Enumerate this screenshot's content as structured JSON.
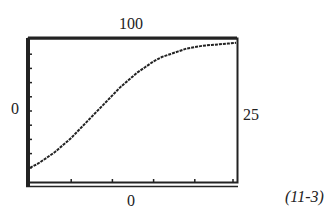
{
  "labels": {
    "top": "100",
    "left": "0",
    "right": "25",
    "bottom": "0",
    "equation_ref": "(11-3)"
  },
  "chart_data": {
    "type": "line",
    "title": "",
    "xlabel": "",
    "ylabel": "",
    "window": {
      "xmin": 0,
      "xmax": 25,
      "ymin": 0,
      "ymax": 100
    },
    "axis_labels": {
      "top": "100",
      "left": "0",
      "right": "25",
      "bottom": "0"
    },
    "grid": false,
    "legend": null,
    "x": [
      0,
      1,
      2,
      3,
      4,
      5,
      6,
      7,
      8,
      9,
      10,
      11,
      12,
      13,
      14,
      15,
      16,
      17,
      18,
      19,
      20,
      21,
      22,
      23,
      24,
      25
    ],
    "series": [
      {
        "name": "logistic curve",
        "values": [
          10,
          13,
          17,
          21,
          26,
          31,
          37,
          43,
          49,
          55,
          61,
          67,
          72,
          77,
          81,
          85,
          88,
          90,
          92,
          94,
          95,
          96,
          96.5,
          97,
          97.5,
          98
        ]
      }
    ],
    "annotations": [
      "(11-3)"
    ]
  }
}
